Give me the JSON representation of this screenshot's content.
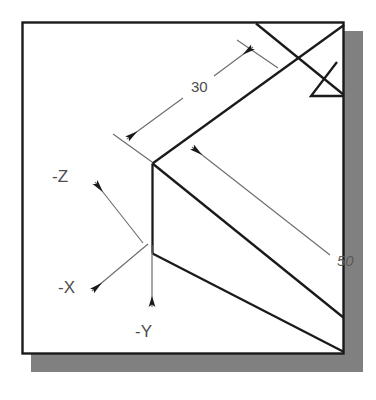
{
  "figure": {
    "kind": "isometric-technical-drawing",
    "background_color": "#ffffff",
    "frame": {
      "border_color": "#1a1a1a",
      "fill_color": "#ffffff",
      "shadow_color": "#808080"
    },
    "line_color": "#1a1a1a",
    "dimension_line_color": "#6b6b6b",
    "arrow_color": "#1a1a1a"
  },
  "dimensions": [
    {
      "name": "dim-30",
      "value": "30",
      "label_x": 191,
      "label_y": 92
    },
    {
      "name": "dim-50",
      "value": "50",
      "label_x": 337,
      "label_y": 266
    }
  ],
  "axes": [
    {
      "name": "axis-neg-z",
      "label": "-Z",
      "label_x": 52,
      "label_y": 182,
      "direction": "up-left"
    },
    {
      "name": "axis-neg-x",
      "label": "-X",
      "label_x": 58,
      "label_y": 293,
      "direction": "down-left"
    },
    {
      "name": "axis-neg-y",
      "label": "-Y",
      "label_x": 135,
      "label_y": 337,
      "direction": "down"
    }
  ]
}
